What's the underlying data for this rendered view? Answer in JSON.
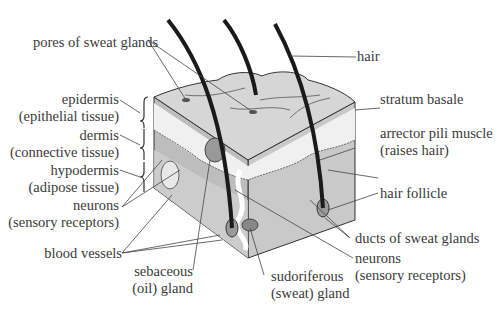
{
  "diagram": {
    "labels": {
      "pores": "pores of sweat glands",
      "hair": "hair",
      "epidermis_1": "epidermis",
      "epidermis_2": "(epithelial tissue)",
      "dermis_1": "dermis",
      "dermis_2": "(connective tissue)",
      "hypodermis_1": "hypodermis",
      "hypodermis_2": "(adipose tissue)",
      "neurons_left_1": "neurons",
      "neurons_left_2": "(sensory receptors)",
      "blood_vessels": "blood vessels",
      "sebaceous_1": "sebaceous",
      "sebaceous_2": "(oil) gland",
      "sudoriferous_1": "sudoriferous",
      "sudoriferous_2": "(sweat) gland",
      "stratum_basale": "stratum basale",
      "arrector_1": "arrector pili muscle",
      "arrector_2": "(raises hair)",
      "hair_follicle": "hair follicle",
      "ducts": "ducts of sweat glands",
      "neurons_right_1": "neurons",
      "neurons_right_2": "(sensory receptors)"
    },
    "colors": {
      "text": "#3a3a3a",
      "leader_lines": "#444444",
      "hair": "#1a1a1a",
      "epidermis_top": "#d6d6d6",
      "epidermis_light": "#efefef",
      "dermis": "#b8b8b8",
      "hypodermis": "#cacaca"
    }
  }
}
